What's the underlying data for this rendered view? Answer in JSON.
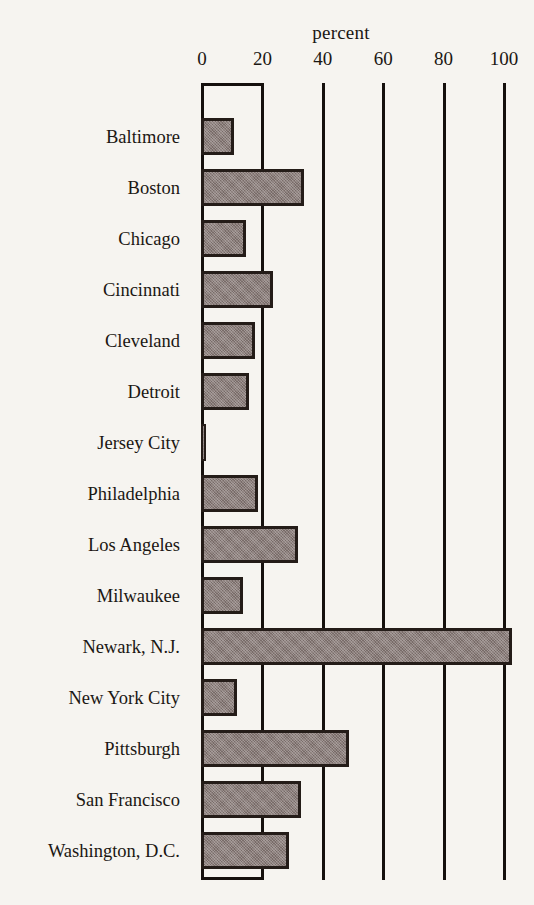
{
  "chart_data": {
    "type": "bar",
    "orientation": "horizontal",
    "title": "percent",
    "xlabel": "percent",
    "ylabel": "",
    "xlim": [
      0,
      110
    ],
    "xticks": [
      0,
      20,
      40,
      60,
      80,
      100
    ],
    "xtick_labels": [
      "0",
      "20",
      "40",
      "60",
      "80",
      "100"
    ],
    "grid": true,
    "grid_axis": "x",
    "legend": "none",
    "bar_fill_color": "#8c7f7c",
    "bar_edge_color": "#241c18",
    "background_color": "#f6f4f0",
    "categories": [
      "Baltimore",
      "Boston",
      "Chicago",
      "Cincinnati",
      "Cleveland",
      "Detroit",
      "Jersey City",
      "Philadelphia",
      "Los Angeles",
      "Milwaukee",
      "Newark, N.J.",
      "New York City",
      "Pittsburgh",
      "San Francisco",
      "Washington, D.C."
    ],
    "values": [
      11,
      34,
      15,
      24,
      18,
      16,
      1,
      19,
      32,
      14,
      103,
      12,
      49,
      33,
      29
    ]
  }
}
